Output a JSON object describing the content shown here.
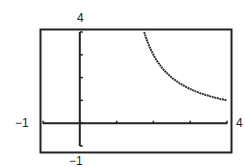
{
  "chart_data": {
    "type": "line",
    "title": "",
    "xlabel": "",
    "ylabel": "",
    "xlim": [
      -1,
      4
    ],
    "ylim": [
      -1,
      4
    ],
    "xticks": [
      -1,
      0,
      1,
      2,
      3,
      4
    ],
    "yticks": [
      -1,
      0,
      1,
      2,
      3,
      4
    ],
    "window_labels": {
      "xmin": "−1",
      "xmax": "4",
      "ymin": "−1",
      "ymax": "4"
    },
    "grid": false,
    "series": [
      {
        "name": "y = 3/(x-1)",
        "x": [
          1.75,
          2,
          2.25,
          2.5,
          3,
          3.5,
          4
        ],
        "y": [
          4,
          3,
          2.4,
          2,
          1.5,
          1.2,
          1
        ]
      }
    ]
  }
}
